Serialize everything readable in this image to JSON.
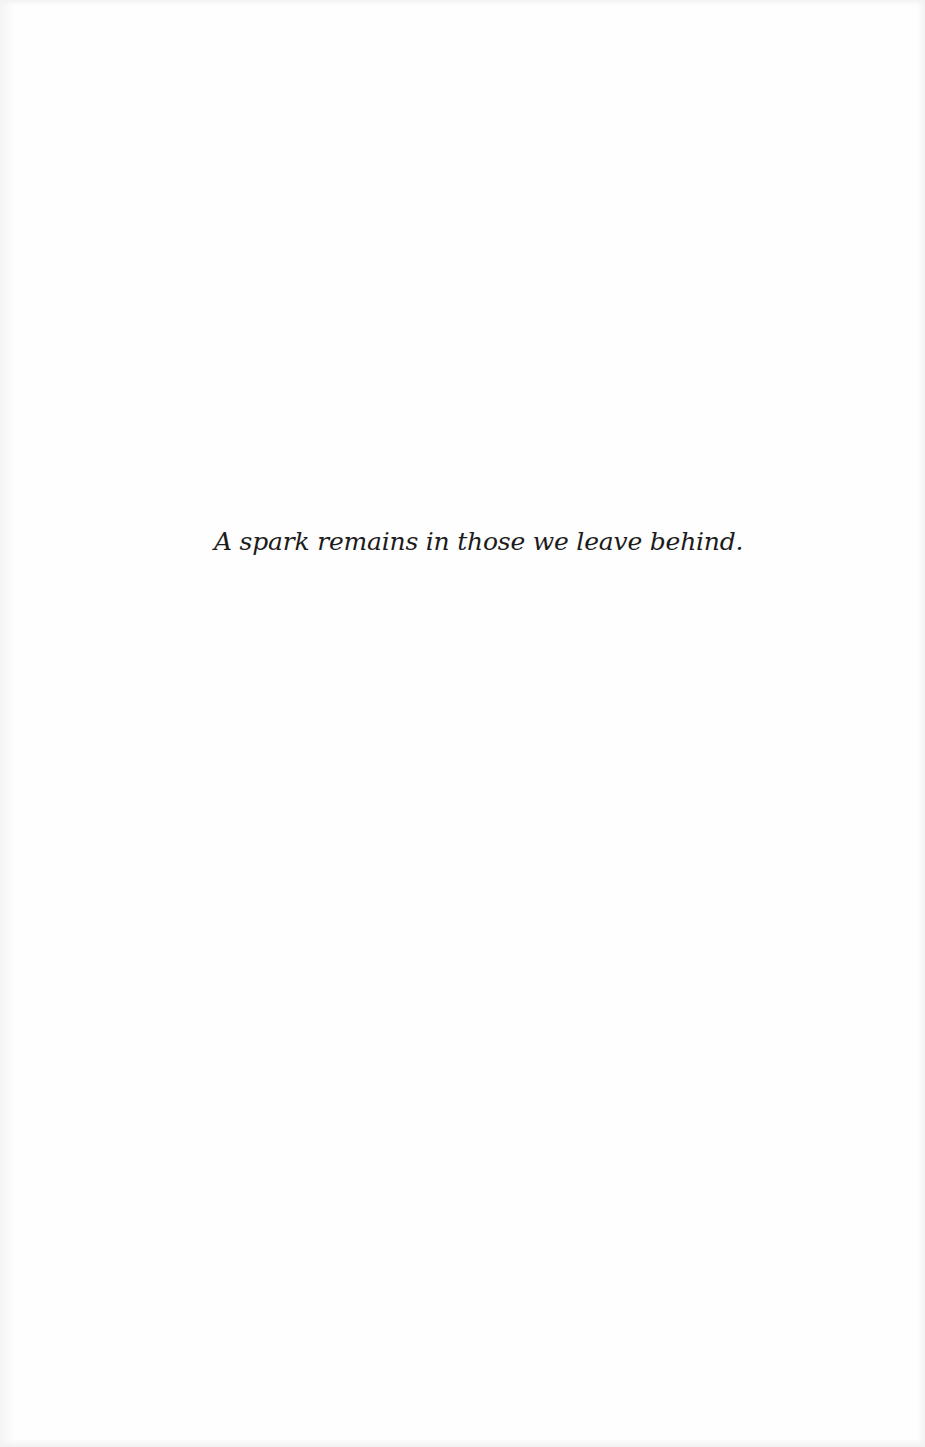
{
  "page": {
    "epigraph": "A spark remains in those we leave behind."
  },
  "colors": {
    "background": "#fefefe",
    "text": "#1c1c1c"
  }
}
